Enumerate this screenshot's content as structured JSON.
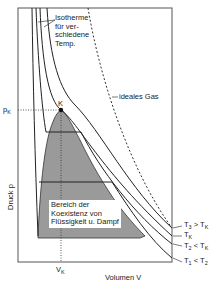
{
  "diagram": {
    "type": "pV-isotherm-diagram",
    "x_axis_label": "Volumen V",
    "y_axis_label": "Druck p",
    "critical_point_label": "K",
    "pk_label": "p",
    "pk_sub": "K",
    "vk_label": "V",
    "vk_sub": "K",
    "isotherm_annotation": [
      "Isotherme",
      "für ver-",
      "schiedene",
      "Temp."
    ],
    "ideal_gas_label": "ideales Gas",
    "coexistence_region_label": [
      "Bereich der",
      "Koexistenz von",
      "Flüssigkeit u. Dampf"
    ],
    "curve_labels": [
      {
        "main": "T",
        "sub": "3",
        "rest": " > T",
        "rest_sub": "K"
      },
      {
        "main": "T",
        "sub": "K",
        "rest": "",
        "rest_sub": ""
      },
      {
        "main": "T",
        "sub": "2",
        "rest": " < T",
        "rest_sub": "K"
      },
      {
        "main": "T",
        "sub": "1",
        "rest": " < T",
        "rest_sub": "2"
      }
    ],
    "colors": {
      "region_fill": "#9a9a9a",
      "line": "#222222",
      "frame": "#555555",
      "background": "#ffffff"
    }
  }
}
